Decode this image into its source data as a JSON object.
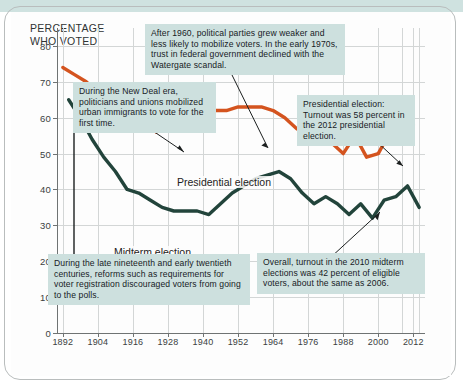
{
  "figure": {
    "axis_title_line1": "PERCENTAGE",
    "axis_title_line2": "WHO VOTED"
  },
  "chart_data": {
    "type": "line",
    "title": "PERCENTAGE WHO VOTED",
    "xlabel": "",
    "ylabel": "PERCENTAGE WHO VOTED",
    "xlim": [
      1890,
      2016
    ],
    "ylim": [
      0,
      85
    ],
    "grid": true,
    "legend": "inline-labels",
    "xticks": [
      1892,
      1904,
      1916,
      1928,
      1940,
      1952,
      1964,
      1976,
      1988,
      2000,
      2012
    ],
    "yticks": [
      0,
      10,
      20,
      30,
      40,
      50,
      60,
      70,
      80
    ],
    "series": [
      {
        "name": "Presidential election",
        "color": "#D4541F",
        "x": [
          1892,
          1896,
          1900,
          1904,
          1908,
          1912,
          1916,
          1920,
          1924,
          1928,
          1932,
          1936,
          1940,
          1944,
          1948,
          1952,
          1956,
          1960,
          1964,
          1968,
          1972,
          1976,
          1980,
          1984,
          1988,
          1992,
          1996,
          2000,
          2004,
          2008,
          2012
        ],
        "values": [
          74,
          72,
          70,
          67,
          66,
          63,
          62,
          60,
          56,
          58,
          60,
          62,
          63,
          62,
          62,
          63,
          63,
          63,
          62,
          60,
          57,
          55,
          53,
          53,
          50,
          55,
          49,
          50,
          56,
          62,
          58
        ]
      },
      {
        "name": "Midterm election",
        "color": "#22443B",
        "x": [
          1894,
          1898,
          1902,
          1906,
          1910,
          1914,
          1918,
          1922,
          1926,
          1930,
          1934,
          1938,
          1942,
          1946,
          1950,
          1954,
          1958,
          1962,
          1966,
          1970,
          1974,
          1978,
          1982,
          1986,
          1990,
          1994,
          1998,
          2002,
          2006,
          2010,
          2014
        ],
        "values": [
          65,
          60,
          54,
          49,
          45,
          40,
          39,
          37,
          35,
          34,
          34,
          34,
          33,
          36,
          39,
          41,
          43,
          44,
          45,
          43,
          39,
          36,
          38,
          36,
          33,
          36,
          32,
          37,
          38,
          41,
          35
        ]
      }
    ],
    "series_inline_labels": [
      {
        "text": "Presidential election",
        "series": "Presidential election"
      },
      {
        "text": "Midterm election",
        "series": "Midterm election"
      }
    ],
    "annotations": [
      {
        "id": "annotation-watergate",
        "text": "After 1960, political parties grew weaker and less likely to mobilize voters. In the early 1970s, trust in federal government declined with the Watergate scandal.",
        "points_to_year": 1964
      },
      {
        "id": "annotation-new-deal",
        "text": "During the New Deal era, politicians and unions mobilized urban immigrants to vote for the first time.",
        "points_to_year": 1932
      },
      {
        "id": "annotation-2012-presidential",
        "text": "Presidential election: Turnout was 58 percent in the 2012 presidential election.",
        "points_to_year": 2012
      },
      {
        "id": "annotation-voter-registration",
        "text": "During the late nineteenth and early twentieth centuries, reforms such as requirements for voter registration discouraged voters from going to the polls.",
        "points_to_year": 1896
      },
      {
        "id": "annotation-2010-midterm",
        "text": "Overall, turnout in the 2010 midterm elections was 42 percent of eligible voters, about the same as 2006.",
        "points_to_year": 2010
      }
    ]
  },
  "colors": {
    "presidential": "#D4541F",
    "midterm": "#22443B",
    "callout_bg": "#CDE0DE",
    "grid": "#D3D6D6",
    "axis": "#6F7373",
    "top_band": "#CFE2E0"
  }
}
